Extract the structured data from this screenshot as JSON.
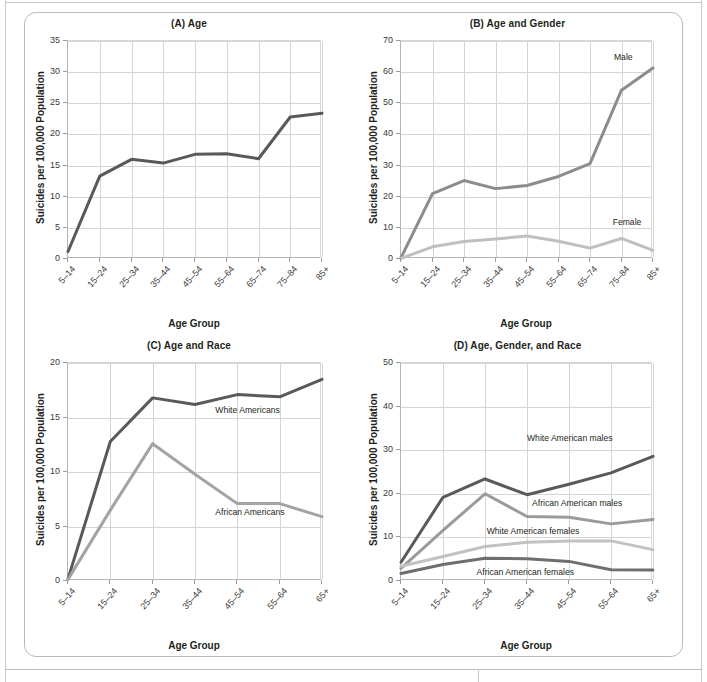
{
  "figure": {
    "common_ylabel": "Suicides per 100,000 Population",
    "common_xlabel": "Age Group",
    "colors": {
      "dark": "#595959",
      "mid_dark": "#6e6e6e",
      "mid": "#8c8c8c",
      "light": "#adadad",
      "lighter": "#bfbfbf",
      "grid": "#d4d4d4",
      "axis": "#b5b5b5",
      "text": "#231f20"
    }
  },
  "chart_data": [
    {
      "id": "panel-a",
      "type": "line",
      "title": "(A) Age",
      "xlabel": "Age Group",
      "ylabel": "Suicides per 100,000 Population",
      "categories": [
        "5–14",
        "15–24",
        "25–34",
        "35–44",
        "45–54",
        "55–64",
        "65–74",
        "75–84",
        "85+"
      ],
      "ylim": [
        0,
        35
      ],
      "yticks": [
        0,
        5,
        10,
        15,
        20,
        25,
        30,
        35
      ],
      "grid": true,
      "legend": "none",
      "series": [
        {
          "name": "All",
          "color": "#595959",
          "values": [
            1.2,
            13.3,
            16.0,
            15.4,
            16.8,
            16.9,
            16.1,
            22.8,
            23.4
          ]
        }
      ]
    },
    {
      "id": "panel-b",
      "type": "line",
      "title": "(B) Age and Gender",
      "xlabel": "Age Group",
      "ylabel": "Suicides per 100,000 Population",
      "categories": [
        "5–14",
        "15–24",
        "25–34",
        "35–44",
        "45–54",
        "55–64",
        "65–74",
        "75–84",
        "85+"
      ],
      "ylim": [
        0,
        70
      ],
      "yticks": [
        0,
        10,
        20,
        30,
        40,
        50,
        60,
        70
      ],
      "grid": true,
      "legend": "inline-annotations",
      "series": [
        {
          "name": "Male",
          "color": "#8c8c8c",
          "values": [
            0.4,
            21.0,
            25.2,
            22.6,
            23.6,
            26.5,
            30.6,
            54.2,
            61.3
          ]
        },
        {
          "name": "Female",
          "color": "#bfbfbf",
          "values": [
            0.2,
            3.9,
            5.6,
            6.4,
            7.4,
            5.7,
            3.5,
            6.6,
            2.8
          ]
        }
      ],
      "annotations": [
        {
          "text": "Male",
          "x_frac": 0.845,
          "y_value": 64.5
        },
        {
          "text": "Female",
          "x_frac": 0.84,
          "y_value": 11.6
        }
      ]
    },
    {
      "id": "panel-c",
      "type": "line",
      "title": "(C) Age and Race",
      "xlabel": "Age Group",
      "ylabel": "Suicides per 100,000 Population",
      "categories": [
        "5–14",
        "15–24",
        "25–34",
        "35–44",
        "45–54",
        "55–64",
        "65+"
      ],
      "ylim": [
        0,
        20
      ],
      "yticks": [
        0,
        5,
        10,
        15,
        20
      ],
      "grid": true,
      "legend": "inline-annotations",
      "series": [
        {
          "name": "White Americans",
          "color": "#595959",
          "values": [
            0.2,
            12.8,
            16.8,
            16.2,
            17.1,
            16.9,
            18.5
          ]
        },
        {
          "name": "African Americans",
          "color": "#a3a3a3",
          "values": [
            0.15,
            6.5,
            12.6,
            9.8,
            7.1,
            7.1,
            5.9
          ]
        }
      ],
      "annotations": [
        {
          "text": "White Americans",
          "x_frac": 0.58,
          "y_value": 15.6
        },
        {
          "text": "African Americans",
          "x_frac": 0.58,
          "y_value": 6.2
        }
      ]
    },
    {
      "id": "panel-d",
      "type": "line",
      "title": "(D) Age, Gender, and Race",
      "xlabel": "Age Group",
      "ylabel": "Suicides per 100,000 Population",
      "categories": [
        "5–14",
        "15–24",
        "25–34",
        "35–44",
        "45–54",
        "55–64",
        "65+"
      ],
      "ylim": [
        0,
        50
      ],
      "yticks": [
        0,
        10,
        20,
        30,
        40,
        50
      ],
      "grid": true,
      "legend": "inline-annotations",
      "series": [
        {
          "name": "White American males",
          "color": "#595959",
          "values": [
            4.3,
            19.2,
            23.4,
            19.8,
            22.2,
            24.8,
            28.6
          ]
        },
        {
          "name": "African American males",
          "color": "#9a9a9a",
          "values": [
            2.9,
            11.6,
            20.0,
            14.8,
            14.6,
            13.1,
            14.1
          ]
        },
        {
          "name": "White American females",
          "color": "#c2c2c2",
          "values": [
            3.4,
            5.6,
            7.9,
            8.9,
            9.2,
            9.2,
            7.2
          ]
        },
        {
          "name": "African American females",
          "color": "#6e6e6e",
          "values": [
            1.7,
            3.8,
            5.2,
            5.1,
            4.5,
            2.6,
            2.5
          ]
        }
      ],
      "annotations": [
        {
          "text": "White American males",
          "x_frac": 0.5,
          "y_value": 32.6
        },
        {
          "text": "African American males",
          "x_frac": 0.52,
          "y_value": 17.6
        },
        {
          "text": "White American females",
          "x_frac": 0.34,
          "y_value": 11.2
        },
        {
          "text": "African American females",
          "x_frac": 0.3,
          "y_value": 1.9
        }
      ]
    }
  ]
}
